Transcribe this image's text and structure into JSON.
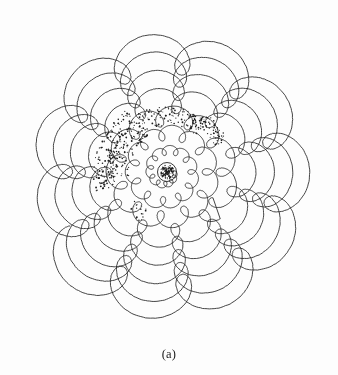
{
  "figure": {
    "caption": "(a)",
    "title": "",
    "background_color": "#fdfdfd",
    "ink_color": "#242424",
    "stipple_color": "#1e1e1e"
  },
  "chart_data": {
    "type": "line",
    "title": "",
    "subtitle": "",
    "xlabel": "",
    "ylabel": "",
    "grid": false,
    "legend": "none",
    "coordinate_system": "polar-parametric",
    "center": {
      "x": 167,
      "y": 172
    },
    "extent": {
      "x_min": 15,
      "x_max": 320,
      "y_min": 13,
      "y_max": 333
    },
    "parameters": {
      "lobes_per_revolution": 12,
      "revolutions": 7.4,
      "theta_start_deg": 0,
      "theta_end_deg": 2664,
      "base_radius_start": 7,
      "base_radius_end": 128,
      "loop_radius_start": 2.2,
      "loop_radius_end": 22,
      "loop_phase_flip_revolution": 3.1,
      "samples": 7400,
      "stroke_width": 0.85
    },
    "axis_ranges": {
      "x": [
        0,
        338
      ],
      "y": [
        0,
        345
      ],
      "r": [
        7,
        150
      ]
    },
    "series": [
      {
        "name": "spiral-epitrochoid-trace",
        "role": "primary-curve",
        "color": "#242424",
        "stroke_width": 0.85,
        "values": []
      }
    ],
    "stipple_bands": [
      {
        "name": "upper-left-outer-band",
        "theta_start_deg": 122,
        "theta_end_deg": 196,
        "radius_inner": 52,
        "radius_outer": 74,
        "dot_count": 150,
        "dot_radius": 0.75
      },
      {
        "name": "upper-left-mid-band",
        "theta_start_deg": 118,
        "theta_end_deg": 186,
        "radius_inner": 38,
        "radius_outer": 58,
        "dot_count": 110,
        "dot_radius": 0.7
      },
      {
        "name": "upper-right-band",
        "theta_start_deg": 52,
        "theta_end_deg": 118,
        "radius_inner": 46,
        "radius_outer": 66,
        "dot_count": 120,
        "dot_radius": 0.7
      },
      {
        "name": "upper-right-outer-fringe",
        "theta_start_deg": 28,
        "theta_end_deg": 62,
        "radius_inner": 54,
        "radius_outer": 70,
        "dot_count": 55,
        "dot_radius": 0.7
      },
      {
        "name": "lower-left-sparse-band",
        "theta_start_deg": 222,
        "theta_end_deg": 244,
        "radius_inner": 42,
        "radius_outer": 56,
        "dot_count": 18,
        "dot_radius": 0.7
      },
      {
        "name": "core-scribble",
        "theta_start_deg": 0,
        "theta_end_deg": 360,
        "radius_inner": 0,
        "radius_outer": 7,
        "dot_count": 120,
        "dot_radius": 0.65
      }
    ],
    "core_marker": {
      "name": "center-circle",
      "radius": 9.5,
      "stroke_width": 0.9
    }
  }
}
